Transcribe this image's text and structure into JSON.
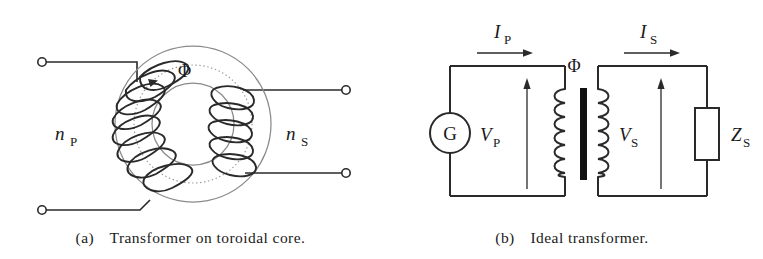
{
  "figure": {
    "type": "diagram",
    "topic": "Transformer schematic figures",
    "panels": [
      {
        "id": "a",
        "caption": "(a) Transformer on toroidal core.",
        "caption_prefix": "(a)",
        "caption_text": "Transformer on toroidal core.",
        "labels": {
          "primary_turns": "n",
          "primary_turns_sub": "P",
          "secondary_turns": "n",
          "secondary_turns_sub": "S",
          "flux": "Φ"
        },
        "elements": [
          "toroidal-core",
          "primary-winding",
          "secondary-winding",
          "flux-path",
          "terminal-top-left",
          "terminal-bottom-left",
          "terminal-top-right",
          "terminal-bottom-right"
        ]
      },
      {
        "id": "b",
        "caption": "(b) Ideal transformer.",
        "caption_prefix": "(b)",
        "caption_text": "Ideal transformer.",
        "labels": {
          "generator": "G",
          "primary_current": "I",
          "primary_current_sub": "P",
          "secondary_current": "I",
          "secondary_current_sub": "S",
          "primary_voltage": "V",
          "primary_voltage_sub": "P",
          "secondary_voltage": "V",
          "secondary_voltage_sub": "S",
          "load_impedance": "Z",
          "load_impedance_sub": "S",
          "flux": "Φ"
        },
        "elements": [
          "generator-symbol",
          "primary-coil",
          "magnetic-core",
          "secondary-coil",
          "load-impedance-box",
          "primary-current-arrow",
          "secondary-current-arrow",
          "primary-voltage-arrow",
          "secondary-voltage-arrow"
        ]
      }
    ]
  },
  "colors": {
    "ink": "#1a1a1a",
    "wire": "#2a2a2a",
    "core_grey": "#8a8a8a",
    "flux_grey": "#9a9a9a",
    "background": "#ffffff",
    "core_fill": "#111111"
  }
}
